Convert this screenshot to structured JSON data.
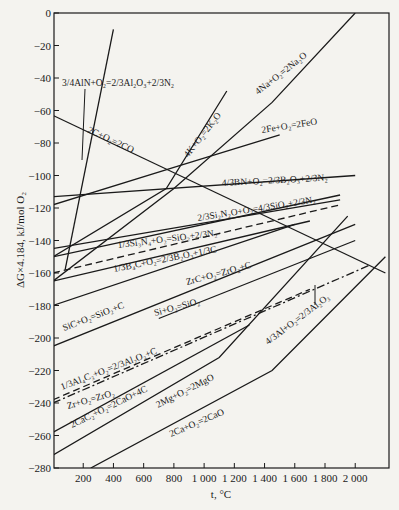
{
  "chart_data": {
    "type": "line",
    "title": "",
    "xlabel": "t, °C",
    "ylabel": "ΔG×4.184, kJ/mol O₂",
    "xlim": [
      0,
      2200
    ],
    "ylim": [
      -280,
      0
    ],
    "x_ticks": [
      200,
      400,
      600,
      800,
      1000,
      1200,
      1400,
      1600,
      1800,
      2000
    ],
    "x_tick_labels": [
      "200",
      "400",
      "600",
      "800",
      "1 000",
      "1 200",
      "1 400",
      "1 600",
      "1 800",
      "2 000"
    ],
    "y_ticks": [
      0,
      -20,
      -40,
      -60,
      -80,
      -100,
      -120,
      -140,
      -160,
      -180,
      -200,
      -220,
      -240,
      -260,
      -280
    ],
    "y_tick_labels": [
      "0",
      "−20",
      "−40",
      "−60",
      "−80",
      "−100",
      "−120",
      "−140",
      "−160",
      "−180",
      "−200",
      "−220",
      "−240",
      "−260",
      "−280"
    ],
    "grid": false,
    "legend": "inline labels",
    "series": [
      {
        "name": "3/4AlN+O2=2/3Al2O3+2/3N2",
        "style": "solid",
        "x": [
          80,
          400
        ],
        "y": [
          -158,
          -10
        ]
      },
      {
        "name": "4Na+O2=2Na2O",
        "style": "solid",
        "x": [
          0,
          800,
          1450,
          2000
        ],
        "y": [
          -165,
          -108,
          -55,
          0
        ]
      },
      {
        "name": "2C+O2=2CO",
        "style": "solid",
        "x": [
          0,
          2200
        ],
        "y": [
          -63,
          -160
        ]
      },
      {
        "name": "4K+O2=2K2O",
        "style": "solid",
        "x": [
          0,
          750,
          1150
        ],
        "y": [
          -150,
          -108,
          -48
        ]
      },
      {
        "name": "2Fe+O2=2FeO",
        "style": "solid",
        "x": [
          0,
          800,
          1500
        ],
        "y": [
          -118,
          -95,
          -75
        ]
      },
      {
        "name": "4/3BN+O2=2/3B2O3+2/3N2",
        "style": "solid",
        "x": [
          0,
          2000
        ],
        "y": [
          -113,
          -100
        ]
      },
      {
        "name": "2/3Si2N2O+O2=4/3SiO2+2/3N2",
        "style": "solid",
        "x": [
          0,
          1900
        ],
        "y": [
          -150,
          -112
        ]
      },
      {
        "name": "1/3Si3N4+O2=SiO2+2/3N2",
        "style": "solid",
        "x": [
          0,
          1900
        ],
        "y": [
          -145,
          -115
        ]
      },
      {
        "name": "1/3B4C+O2=2/3B2O3+1/3C",
        "style": "dashed",
        "x": [
          0,
          1900
        ],
        "y": [
          -160,
          -118
        ]
      },
      {
        "name": "ZrC+O2=ZrO2+C",
        "style": "solid",
        "x": [
          0,
          1700
        ],
        "y": [
          -165,
          -128
        ]
      },
      {
        "name": "SiC+O2=SiO2+C",
        "style": "solid",
        "x": [
          0,
          1600
        ],
        "y": [
          -180,
          -130
        ]
      },
      {
        "name": "Si+O2=SiO2",
        "style": "solid",
        "x": [
          700,
          2000
        ],
        "y": [
          -188,
          -140
        ]
      },
      {
        "name": "1/3Al4C3+O2=2/3Al2O3+C",
        "style": "solid",
        "x": [
          0,
          2000
        ],
        "y": [
          -205,
          -130
        ]
      },
      {
        "name": "Zr+O2=ZrO2",
        "style": "dashed",
        "x": [
          0,
          1700
        ],
        "y": [
          -238,
          -170
        ]
      },
      {
        "name": "4/3Al+O2=2/3Al2O3",
        "style": "dash-dot",
        "x": [
          0,
          2100
        ],
        "y": [
          -240,
          -155
        ]
      },
      {
        "name": "2CaC2+O2=2CaO+4C",
        "style": "solid",
        "x": [
          0,
          1300
        ],
        "y": [
          -258,
          -192
        ]
      },
      {
        "name": "2Mg+O2=2MgO",
        "style": "solid",
        "x": [
          0,
          1100,
          1950
        ],
        "y": [
          -272,
          -212,
          -125
        ]
      },
      {
        "name": "2Ca+O2=2CaO",
        "style": "solid",
        "x": [
          250,
          1450,
          2200
        ],
        "y": [
          -280,
          -220,
          -150
        ]
      }
    ],
    "annotations": [
      "3/4AlN+O2=2/3Al2O3+2/3N2",
      "4Na+O2=2Na2O",
      "2C+O2=2CO",
      "4K+O2=2K2O",
      "2Fe+O2=2FeO",
      "4/3BN+O2=2/3B2O3+2/3N2",
      "2/3Si2N2O+O2=4/3SiO2+2/3N2",
      "1/3Si3N4+O2=SiO2+2/3N2",
      "1/3B4C+O2=2/3B2O3+1/3C",
      "ZrC+O2=ZrO2+C",
      "SiC+O2=SiO2+C",
      "Si+O2=SiO2",
      "1/3Al4C3+O2=2/3Al2O3+C",
      "Zr+O2=ZrO2",
      "2CaC2+O2=2CaO+4C",
      "2Mg+O2=2MgO",
      "2Ca+O2=2CaO",
      "4/3Al+O2=2/3Al2O3"
    ]
  },
  "labels": {
    "aln": "3/4AlN+O₂=2/3Al₂O₃+2/3N₂",
    "na": "4Na+O₂=2Na₂O",
    "co": "2C+O₂=2CO",
    "k": "4K+O₂=2K₂O",
    "fe": "2Fe+O₂=2FeO",
    "bn": "4/3BN+O₂=2/3B₂O₃+2/3N₂",
    "si2n2o": "2/3Si₂N₂O+O₂=4/3SiO₂+2/3N₂",
    "si3n4": "1/3Si₃N₄+O₂=SiO₂+2/3N₂",
    "b4c": "1/3B₄C+O₂=2/3B₂O₃+1/3C",
    "zrc": "ZrC+O₂=ZrO₂+C",
    "sic": "SiC+O₂=SiO₂+C",
    "si": "Si+O₂=SiO₂",
    "al4c3": "1/3Al₄C₃+O₂=2/3Al₂O₃+C",
    "zr": "Zr+O₂=ZrO₂",
    "cac2": "2CaC₂+O₂=2CaO+4C",
    "mg": "2Mg+O₂=2MgO",
    "ca": "2Ca+O₂=2CaO",
    "al": "4/3Al+O₂=2/3Al₂O₃"
  },
  "axes": {
    "xlabel": "t, °C",
    "ylabel": "ΔG×4.184, kJ/mol O₂"
  }
}
